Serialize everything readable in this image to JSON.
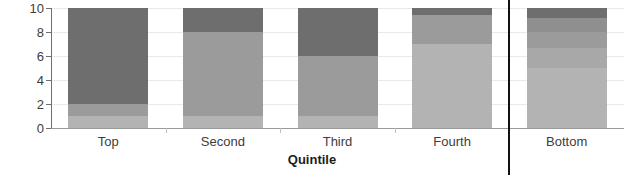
{
  "chart_data": {
    "type": "bar",
    "title": "",
    "subtitle": "",
    "xlabel": "Quintile",
    "ylabel": "",
    "stacked": true,
    "grid": true,
    "legend": null,
    "ylim": [
      0,
      10
    ],
    "yticks": [
      0,
      2,
      4,
      6,
      8,
      10
    ],
    "ytick_labels": [
      "0",
      "2",
      "4",
      "6",
      "8",
      "10"
    ],
    "categories": [
      "Top",
      "Second",
      "Third",
      "Fourth",
      "Bottom"
    ],
    "series": [
      {
        "name": "segment-1",
        "color": "#b3b3b3",
        "values": [
          1.0,
          1.0,
          1.0,
          7.0,
          5.0
        ]
      },
      {
        "name": "segment-2",
        "color": "#a8a8a8",
        "values": [
          1.0,
          7.0,
          5.0,
          2.4,
          1.7
        ]
      },
      {
        "name": "segment-3",
        "color": "#9b9b9b",
        "values": [
          8.0,
          0.0,
          4.0,
          0.0,
          1.3
        ]
      },
      {
        "name": "segment-4",
        "color": "#8f8f8f",
        "values": [
          0.0,
          0.0,
          0.0,
          0.0,
          1.2
        ]
      },
      {
        "name": "segment-5",
        "color": "#6e6e6e",
        "values": [
          0.0,
          2.0,
          0.0,
          0.6,
          0.8
        ]
      }
    ],
    "bar_segment_boundaries": {
      "Top": [
        0,
        1,
        2,
        10
      ],
      "Second": [
        0,
        1,
        8,
        10
      ],
      "Third": [
        0,
        1,
        6,
        10
      ],
      "Fourth": [
        0,
        7,
        9.4,
        10
      ],
      "Bottom": [
        0,
        5,
        6.7,
        8,
        9.2,
        10
      ]
    },
    "annotations": {
      "vertical_divider": {
        "name": "bottom-quintile-divider",
        "position_between": [
          "Fourth",
          "Bottom"
        ],
        "color": "#111111"
      }
    },
    "colors": {
      "dark": "#6e6e6e",
      "mid_dark": "#8f8f8f",
      "mid": "#9b9b9b",
      "mid_light": "#a8a8a8",
      "light": "#b3b3b3",
      "grid": "#e9e9e9",
      "axis": "#6f6f6f",
      "text": "#3d3d3d"
    }
  }
}
